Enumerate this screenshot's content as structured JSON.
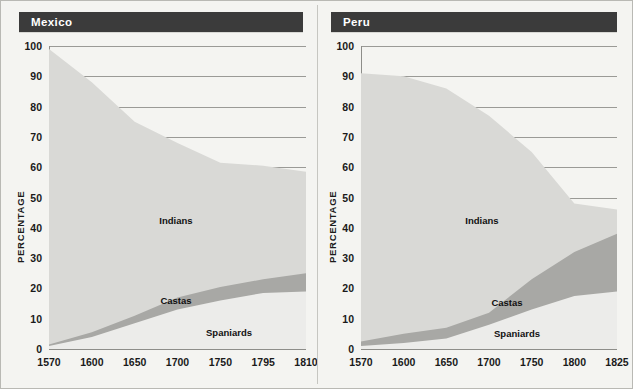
{
  "axis_title": "PERCENTAGE",
  "colors": {
    "title_bar": "#3b3b3b",
    "title_text": "#ffffff",
    "indians": "#d9d9d6",
    "castas": "#a8a8a5",
    "spaniards": "#ececea",
    "gridline": "#9a9a96",
    "page_background": "#f4f4f1"
  },
  "panels": [
    {
      "title": "Mexico"
    },
    {
      "title": "Peru"
    }
  ],
  "chart_data": [
    {
      "type": "area",
      "title": "Mexico",
      "xlabel": "",
      "ylabel": "PERCENTAGE",
      "ylim": [
        0,
        100
      ],
      "yticks": [
        0,
        10,
        20,
        30,
        40,
        50,
        60,
        70,
        80,
        90,
        100
      ],
      "xticks": [
        "1570",
        "1600",
        "1650",
        "1700",
        "1750",
        "1795",
        "1810"
      ],
      "x": [
        1570,
        1600,
        1650,
        1700,
        1750,
        1795,
        1810
      ],
      "grid": true,
      "legend": "inline-labels",
      "stacked": true,
      "series": [
        {
          "name": "Spaniards",
          "values": [
            1.0,
            4.0,
            8.5,
            13.0,
            16.0,
            18.5,
            19.0
          ]
        },
        {
          "name": "Castas",
          "values": [
            0.5,
            1.5,
            2.5,
            4.0,
            4.5,
            4.5,
            6.0
          ]
        },
        {
          "name": "Indians",
          "values": [
            97.5,
            82.5,
            64.0,
            51.0,
            41.0,
            37.5,
            33.5
          ]
        }
      ],
      "cumulative_tops": {
        "spaniards": [
          1.0,
          4.0,
          8.5,
          13.0,
          16.0,
          18.5,
          19.0
        ],
        "castas": [
          1.5,
          5.5,
          11.0,
          17.0,
          20.5,
          23.0,
          25.0
        ],
        "indians": [
          99.0,
          88.0,
          75.0,
          68.0,
          61.5,
          60.5,
          58.5
        ]
      }
    },
    {
      "type": "area",
      "title": "Peru",
      "xlabel": "",
      "ylabel": "PERCENTAGE",
      "ylim": [
        0,
        100
      ],
      "yticks": [
        0,
        10,
        20,
        30,
        40,
        50,
        60,
        70,
        80,
        90,
        100
      ],
      "xticks": [
        "1570",
        "1600",
        "1650",
        "1700",
        "1750",
        "1800",
        "1825"
      ],
      "x": [
        1570,
        1600,
        1650,
        1700,
        1750,
        1800,
        1825
      ],
      "grid": true,
      "legend": "inline-labels",
      "stacked": true,
      "series": [
        {
          "name": "Spaniards",
          "values": [
            1.0,
            2.0,
            3.5,
            8.0,
            13.0,
            17.5,
            19.0
          ]
        },
        {
          "name": "Castas",
          "values": [
            1.5,
            3.0,
            3.5,
            4.0,
            10.0,
            14.5,
            19.0
          ]
        },
        {
          "name": "Indians",
          "values": [
            88.5,
            85.0,
            79.0,
            65.0,
            42.0,
            16.0,
            8.0
          ]
        }
      ],
      "cumulative_tops": {
        "spaniards": [
          1.0,
          2.0,
          3.5,
          8.0,
          13.0,
          17.5,
          19.0
        ],
        "castas": [
          2.5,
          5.0,
          7.0,
          12.0,
          23.0,
          32.0,
          38.0
        ],
        "indians": [
          91.0,
          90.0,
          86.0,
          77.0,
          65.0,
          48.0,
          46.0
        ]
      }
    }
  ],
  "series_labels": [
    {
      "name": "Indians"
    },
    {
      "name": "Castas"
    },
    {
      "name": "Spaniards"
    }
  ]
}
